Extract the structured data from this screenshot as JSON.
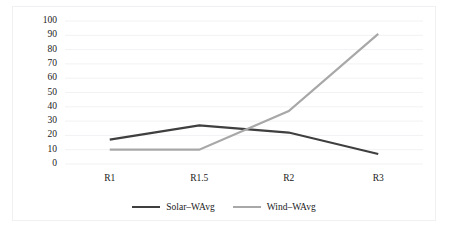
{
  "chart_data": {
    "type": "line",
    "title": "",
    "xlabel": "",
    "ylabel": "",
    "categories": [
      "R1",
      "R1.5",
      "R2",
      "R3"
    ],
    "ylim": [
      0,
      100
    ],
    "yticks": [
      0,
      10,
      20,
      30,
      40,
      50,
      60,
      70,
      80,
      90,
      100
    ],
    "grid": true,
    "legend_position": "bottom",
    "series": [
      {
        "name": "Solar–WAvg",
        "color": "#3f3f3f",
        "values": [
          17,
          27,
          22,
          7
        ]
      },
      {
        "name": "Wind–WAvg",
        "color": "#a8a8a8",
        "values": [
          10,
          10,
          37,
          91
        ]
      }
    ]
  },
  "axis": {
    "y_tick_labels": [
      "100",
      "90",
      "80",
      "70",
      "60",
      "50",
      "40",
      "30",
      "20",
      "10",
      "0"
    ],
    "x_tick_labels": [
      "R1",
      "R1.5",
      "R2",
      "R3"
    ]
  },
  "legend": {
    "items": [
      {
        "label": "Solar–WAvg",
        "color": "#3f3f3f"
      },
      {
        "label": "Wind–WAvg",
        "color": "#a8a8a8"
      }
    ]
  },
  "style": {
    "grid_color": "#f2f2f4",
    "border_color": "#f0f0f2",
    "text_color": "#1a1a1a",
    "background": "#ffffff"
  }
}
